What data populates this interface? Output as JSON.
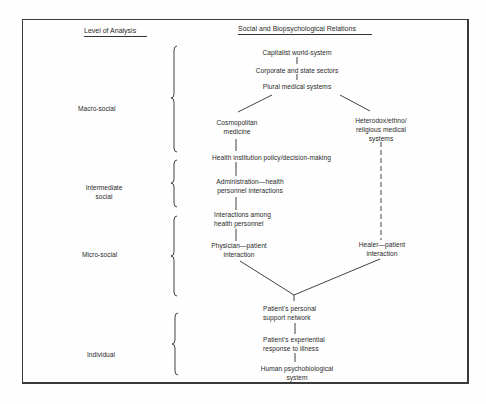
{
  "headers": {
    "level_of_analysis": "Level of Analysis",
    "relations": "Social and Biopsychological Relations"
  },
  "levels": [
    {
      "id": "macro",
      "label": "Macro-social"
    },
    {
      "id": "intermediate",
      "label_lines": [
        "Intermediate",
        "social"
      ]
    },
    {
      "id": "micro",
      "label": "Micro-social"
    },
    {
      "id": "individual",
      "label": "Individual"
    }
  ],
  "nodes": {
    "capitalist": [
      "Capitalist world-system"
    ],
    "corporate": [
      "Corporate and state sectors"
    ],
    "plural": [
      "Plural medical systems"
    ],
    "cosmopolitan": [
      "Cosmopolitan",
      "medicine"
    ],
    "heterodox": [
      "Heterodox/ethno/",
      "religious medical",
      "systems"
    ],
    "policy": [
      "Health institution policy/decision-making"
    ],
    "administration": [
      "Administration—health",
      "personnel interactions"
    ],
    "interactions": [
      "Interactions among",
      "health personnel"
    ],
    "physician": [
      "Physician—patient",
      "interaction"
    ],
    "healer": [
      "Healer—patient",
      "interaction"
    ],
    "support": [
      "Patient's personal",
      "support network"
    ],
    "experiential": [
      "Patient's experiential",
      "response to illness"
    ],
    "human": [
      "Human psychobiological",
      "system"
    ]
  },
  "edges": [
    {
      "from": "capitalist",
      "to": "corporate",
      "style": "solid"
    },
    {
      "from": "corporate",
      "to": "plural",
      "style": "solid"
    },
    {
      "from": "plural",
      "to": "cosmopolitan",
      "style": "solid"
    },
    {
      "from": "plural",
      "to": "heterodox",
      "style": "solid"
    },
    {
      "from": "cosmopolitan",
      "to": "policy",
      "style": "solid"
    },
    {
      "from": "policy",
      "to": "administration",
      "style": "solid"
    },
    {
      "from": "administration",
      "to": "interactions",
      "style": "solid"
    },
    {
      "from": "interactions",
      "to": "physician",
      "style": "solid"
    },
    {
      "from": "heterodox",
      "to": "healer",
      "style": "dashed"
    },
    {
      "from": "physician",
      "to": "support",
      "style": "solid"
    },
    {
      "from": "healer",
      "to": "support",
      "style": "solid"
    },
    {
      "from": "support",
      "to": "experiential",
      "style": "solid"
    },
    {
      "from": "experiential",
      "to": "human",
      "style": "solid"
    }
  ]
}
